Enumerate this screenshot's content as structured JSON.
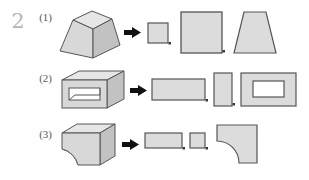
{
  "page": {
    "problem_number": "2",
    "background_color": "#ffffff"
  },
  "palette": {
    "face_light": "#e3e3e3",
    "face_mid": "#d2d2d2",
    "face_dark": "#bfbfbf",
    "outline": "#555555",
    "outline_dark": "#3a3a3a",
    "arrow": "#111111",
    "number_gray": "#b9b9b9",
    "label_gray": "#575757",
    "hole_white": "#ffffff"
  },
  "rows": [
    {
      "label": "(1)",
      "solid": {
        "name": "truncated-square-pyramid",
        "description": "frustum of a square pyramid drawn in isometric view"
      },
      "arrow": "right-arrow",
      "views": [
        {
          "name": "top-view",
          "shape": "square",
          "width": 20,
          "height": 20
        },
        {
          "name": "front-view",
          "shape": "square",
          "width": 40,
          "height": 40
        },
        {
          "name": "side-view",
          "shape": "trapezoid",
          "top_width": 22,
          "bottom_width": 42,
          "height": 40
        }
      ],
      "separators": [
        "dot",
        "dot"
      ]
    },
    {
      "label": "(2)",
      "solid": {
        "name": "rectangular-block-with-through-hole",
        "description": "rectangular box with a rectangular through-hole in the front face"
      },
      "arrow": "right-arrow",
      "views": [
        {
          "name": "top-view",
          "shape": "rectangle",
          "width": 52,
          "height": 20
        },
        {
          "name": "side-view",
          "shape": "rectangle",
          "width": 17,
          "height": 28
        },
        {
          "name": "front-view",
          "shape": "rectangle-with-rectangular-hole",
          "width": 52,
          "height": 28,
          "hole_width": 30,
          "hole_height": 12
        }
      ],
      "separators": [
        "dot",
        "dot"
      ]
    },
    {
      "label": "(3)",
      "solid": {
        "name": "block-with-quarter-round-cutout",
        "description": "rectangular block with a concave quarter-cylinder cut at the lower front"
      },
      "arrow": "right-arrow",
      "views": [
        {
          "name": "top-view",
          "shape": "rectangle",
          "width": 36,
          "height": 14
        },
        {
          "name": "side-view",
          "shape": "square",
          "width": 14,
          "height": 14
        },
        {
          "name": "front-view",
          "shape": "square-with-quarter-circle-cut",
          "width": 40,
          "height": 38,
          "cut_corner": "bottom-left",
          "cut_radius": 22
        }
      ],
      "separators": [
        "dot",
        "dot"
      ]
    }
  ]
}
